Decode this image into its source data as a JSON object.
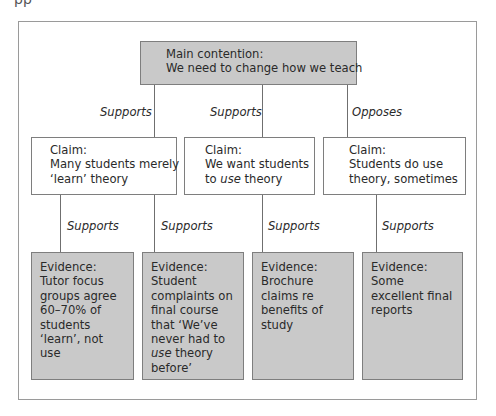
{
  "clipped_header": "pp",
  "main": {
    "lines": [
      "Main contention:",
      "We need to change how we teach"
    ]
  },
  "relations_top": [
    "Supports",
    "Supports",
    "Opposes"
  ],
  "claims": [
    {
      "heading": "Claim:",
      "lines": [
        "Many students merely",
        "‘learn’ theory"
      ]
    },
    {
      "heading": "Claim:",
      "lines": [
        "We want students",
        "to ",
        "use",
        " theory"
      ]
    },
    {
      "heading": "Claim:",
      "lines": [
        "Students do use",
        "theory, sometimes"
      ]
    }
  ],
  "relations_bottom": [
    "Supports",
    "Supports",
    "Supports",
    "Supports"
  ],
  "evidence": [
    {
      "heading": "Evidence:",
      "lines": [
        "Tutor focus",
        "groups agree",
        "60–70% of",
        "students",
        "‘learn’, not",
        "use"
      ]
    },
    {
      "heading": "Evidence:",
      "lines": [
        "Student",
        "complaints on",
        "final course",
        "that ‘We’ve",
        "never had to",
        "use",
        " theory",
        "before’"
      ]
    },
    {
      "heading": "Evidence:",
      "lines": [
        "Brochure",
        "claims re",
        "benefits of",
        "study"
      ]
    },
    {
      "heading": "Evidence:",
      "lines": [
        "Some",
        "excellent final",
        "reports"
      ]
    }
  ],
  "colors": {
    "box_fill": "#c9c9c9",
    "border": "#7e7e7e",
    "frame": "#9a9a9a"
  }
}
